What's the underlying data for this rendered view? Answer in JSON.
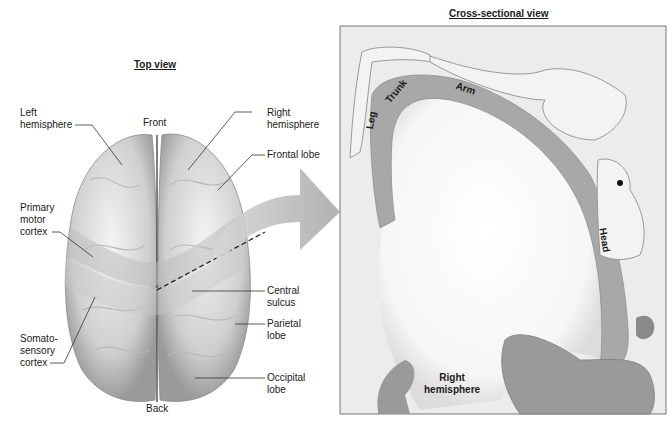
{
  "top_view": {
    "title": "Top view",
    "labels": {
      "left_hemisphere": "Left\nhemisphere",
      "front": "Front",
      "right_hemisphere": "Right\nhemisphere",
      "frontal_lobe": "Frontal lobe",
      "primary_motor_cortex": "Primary\nmotor\ncortex",
      "central_sulcus": "Central\nsulcus",
      "parietal_lobe": "Parietal\nlobe",
      "somatosensory_cortex": "Somato-\nsensory\ncortex",
      "occipital_lobe": "Occipital\nlobe",
      "back": "Back"
    }
  },
  "cross_section": {
    "title": "Cross-sectional view",
    "body_labels": {
      "leg": "Leg",
      "trunk": "Trunk",
      "arm": "Arm",
      "head": "Head"
    },
    "hemisphere_label": "Right\nhemisphere"
  },
  "colors": {
    "brain": "#d9d9d9",
    "cortex_band": "#a8a8a8",
    "panel_bg": "#ececec",
    "arrow": "#b5b5b5"
  }
}
